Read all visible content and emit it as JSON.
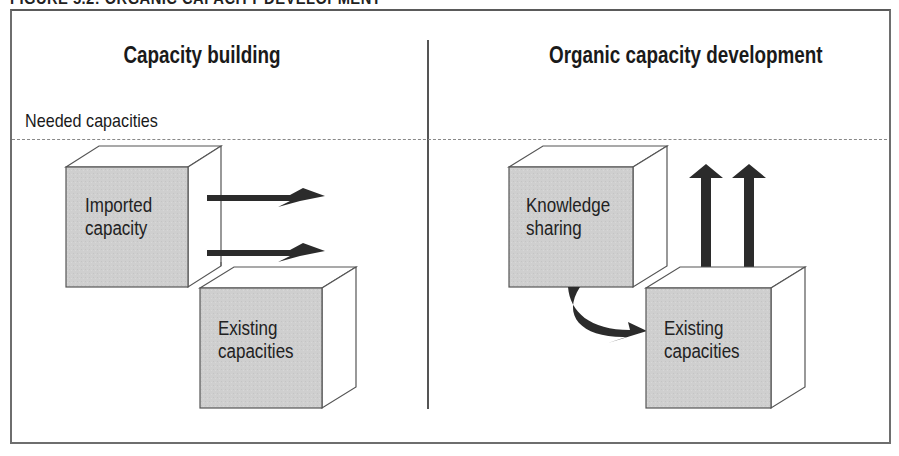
{
  "figure": {
    "title": "FIGURE 5.2: ORGANIC CAPACITY DEVELOPMENT"
  },
  "panels": {
    "left": {
      "heading": "Capacity building",
      "needed_label": "Needed capacities",
      "cubes": [
        {
          "label_line1": "Imported",
          "label_line2": "capacity"
        },
        {
          "label_line1": "Existing",
          "label_line2": "capacities"
        }
      ],
      "arrows": [
        "right-arrow",
        "right-arrow"
      ]
    },
    "right": {
      "heading": "Organic capacity development",
      "cubes": [
        {
          "label_line1": "Knowledge",
          "label_line2": "sharing"
        },
        {
          "label_line1": "Existing",
          "label_line2": "capacities"
        }
      ],
      "arrows": [
        "curved-arrow",
        "up-arrow",
        "up-arrow"
      ]
    }
  },
  "colors": {
    "cube_front": "#cfcfcf",
    "cube_side": "#ffffff",
    "cube_edge": "#555555",
    "arrow": "#2b2b2b",
    "dashed_line": "#888888",
    "frame": "#6e6e6e"
  }
}
